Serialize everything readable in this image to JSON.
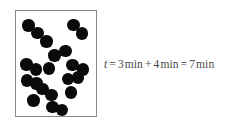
{
  "figure": {
    "name": "molecular-diffusion-diagram",
    "box": {
      "border_color": "#8a8a8a",
      "fill_color": "#ffffff",
      "x": 15,
      "y": 10,
      "width": 82,
      "height": 107
    },
    "particle": {
      "color": "#0a0a0a",
      "shape": "dimer",
      "radius_px": 6.2,
      "count_molecules": 13,
      "count_atoms": 26
    },
    "molecules": [
      {
        "id": 1,
        "atoms": [
          {
            "cx": 12.5,
            "cy": 14.5
          },
          {
            "cx": 21.5,
            "cy": 22.0
          }
        ]
      },
      {
        "id": 2,
        "atoms": [
          {
            "cx": 57.5,
            "cy": 14.0
          },
          {
            "cx": 66.0,
            "cy": 22.5
          }
        ]
      },
      {
        "id": 3,
        "atoms": [
          {
            "cx": 30.5,
            "cy": 30.5
          },
          {
            "cx": 30.5,
            "cy": 30.5
          }
        ]
      },
      {
        "id": 4,
        "atoms": [
          {
            "cx": 38.5,
            "cy": 44.5
          },
          {
            "cx": 49.5,
            "cy": 40.0
          }
        ]
      },
      {
        "id": 5,
        "atoms": [
          {
            "cx": 10.5,
            "cy": 53.5
          },
          {
            "cx": 20.0,
            "cy": 58.5
          }
        ]
      },
      {
        "id": 6,
        "atoms": [
          {
            "cx": 56.5,
            "cy": 54.0
          },
          {
            "cx": 67.0,
            "cy": 58.5
          }
        ]
      },
      {
        "id": 7,
        "atoms": [
          {
            "cx": 33.0,
            "cy": 57.5
          },
          {
            "cx": 33.0,
            "cy": 57.5
          }
        ]
      },
      {
        "id": 8,
        "atoms": [
          {
            "cx": 11.0,
            "cy": 69.5
          },
          {
            "cx": 20.5,
            "cy": 72.5
          }
        ]
      },
      {
        "id": 9,
        "atoms": [
          {
            "cx": 52.0,
            "cy": 68.0
          },
          {
            "cx": 62.0,
            "cy": 66.5
          }
        ]
      },
      {
        "id": 10,
        "atoms": [
          {
            "cx": 26.5,
            "cy": 78.0
          },
          {
            "cx": 35.5,
            "cy": 84.0
          }
        ]
      },
      {
        "id": 11,
        "atoms": [
          {
            "cx": 55.0,
            "cy": 81.5
          },
          {
            "cx": 55.0,
            "cy": 81.5
          }
        ]
      },
      {
        "id": 12,
        "atoms": [
          {
            "cx": 17.5,
            "cy": 89.5
          },
          {
            "cx": 17.5,
            "cy": 89.5
          }
        ]
      },
      {
        "id": 13,
        "atoms": [
          {
            "cx": 36.5,
            "cy": 96.0
          },
          {
            "cx": 46.0,
            "cy": 99.0
          }
        ]
      }
    ]
  },
  "equation": {
    "variable": "t",
    "equals_1": "=",
    "term_1_value": "3",
    "term_1_unit": "min",
    "plus": "+",
    "term_2_value": "4",
    "term_2_unit": "min",
    "equals_2": "=",
    "result_value": "7",
    "result_unit": "min",
    "full_text": "t = 3 min + 4 min = 7 min",
    "text_color": "#4a4a4a"
  }
}
